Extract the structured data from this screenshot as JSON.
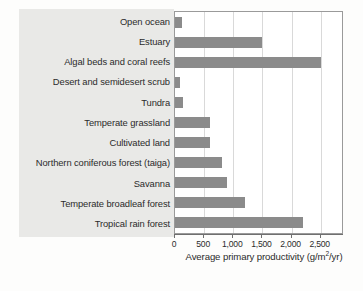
{
  "chart_data": {
    "type": "bar",
    "orientation": "horizontal",
    "title": "",
    "xlabel": "Average primary productivity (g/m2/yr)",
    "xlabel_parts": {
      "text_before": "Average primary productivity (g/m",
      "superscript": "2",
      "text_after": "/yr)"
    },
    "ylabel": "",
    "categories": [
      "Open ocean",
      "Estuary",
      "Algal beds and coral reefs",
      "Desert and semidesert scrub",
      "Tundra",
      "Temperate grassland",
      "Cultivated land",
      "Northern coniferous forest (taiga)",
      "Savanna",
      "Temperate broadleaf forest",
      "Tropical rain forest"
    ],
    "values": [
      125,
      1500,
      2500,
      90,
      140,
      600,
      600,
      800,
      900,
      1200,
      2200
    ],
    "xlim": [
      0,
      2900
    ],
    "xticks": [
      0,
      500,
      1000,
      1500,
      2000,
      2500
    ],
    "xtick_labels": [
      "0",
      "500",
      "1,000",
      "1,500",
      "2,000",
      "2,500"
    ],
    "grid": "vertical",
    "legend": "none",
    "bar_color": "#8b8b8b",
    "plot_background": "#ffffff",
    "label_panel_color": "#e9e9e7",
    "gridline_color": "#d9d9d9",
    "axis_color": "#6f6f6f"
  }
}
